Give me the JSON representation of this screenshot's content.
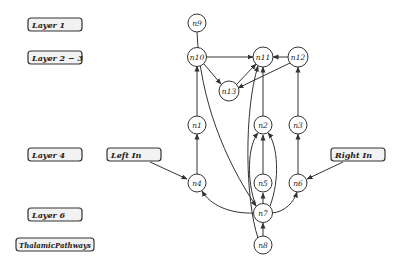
{
  "diagram": {
    "type": "directed-graph",
    "layer_labels": [
      {
        "id": "layer1",
        "label": "Layer 1"
      },
      {
        "id": "layer23",
        "label": "Layer 2 − 3"
      },
      {
        "id": "layer4",
        "label": "Layer 4"
      },
      {
        "id": "layer6",
        "label": "Layer 6"
      },
      {
        "id": "thalamic",
        "label": "ThalamicPathways"
      }
    ],
    "inputs": [
      {
        "id": "left_in",
        "label": "Left In"
      },
      {
        "id": "right_in",
        "label": "Right In"
      }
    ],
    "nodes": [
      {
        "id": "n1",
        "label": "n1"
      },
      {
        "id": "n2",
        "label": "n2"
      },
      {
        "id": "n3",
        "label": "n3"
      },
      {
        "id": "n4",
        "label": "n4"
      },
      {
        "id": "n5",
        "label": "n5"
      },
      {
        "id": "n6",
        "label": "n6"
      },
      {
        "id": "n7",
        "label": "n7"
      },
      {
        "id": "n8",
        "label": "n8"
      },
      {
        "id": "n9",
        "label": "n9"
      },
      {
        "id": "n10",
        "label": "n10"
      },
      {
        "id": "n11",
        "label": "n11"
      },
      {
        "id": "n12",
        "label": "n12"
      },
      {
        "id": "n13",
        "label": "n13"
      }
    ],
    "edges": [
      {
        "from": "Left In",
        "to": "n4"
      },
      {
        "from": "Right In",
        "to": "n6"
      },
      {
        "from": "n4",
        "to": "n1"
      },
      {
        "from": "n1",
        "to": "n10"
      },
      {
        "from": "n10",
        "to": "n11"
      },
      {
        "from": "n10",
        "to": "n13"
      },
      {
        "from": "n13",
        "to": "n11"
      },
      {
        "from": "n12",
        "to": "n11"
      },
      {
        "from": "n12",
        "to": "n13"
      },
      {
        "from": "n2",
        "to": "n11"
      },
      {
        "from": "n3",
        "to": "n12"
      },
      {
        "from": "n6",
        "to": "n3"
      },
      {
        "from": "n5",
        "to": "n2"
      },
      {
        "from": "n7",
        "to": "n2"
      },
      {
        "from": "n7",
        "to": "n2"
      },
      {
        "from": "n7",
        "to": "n5"
      },
      {
        "from": "n7",
        "to": "n4"
      },
      {
        "from": "n7",
        "to": "n6"
      },
      {
        "from": "n8",
        "to": "n7"
      },
      {
        "from": "n9",
        "to": "n7"
      },
      {
        "from": "n11",
        "to": "n7"
      },
      {
        "from": "n8",
        "to": "n11"
      }
    ]
  }
}
